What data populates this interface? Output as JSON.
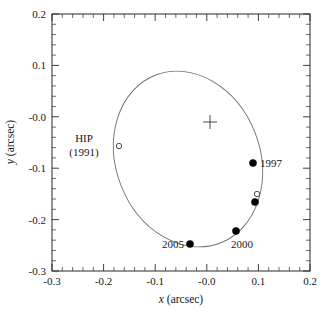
{
  "chart_data": {
    "type": "scatter",
    "title": "",
    "xlabel": "x (arcsec)",
    "ylabel": "y (arcsec)",
    "xlim": [
      -0.3,
      0.2
    ],
    "ylim": [
      -0.3,
      0.2
    ],
    "grid": false,
    "legend": "none",
    "xticks": [
      "-0.3",
      "-0.2",
      "-0.1",
      "-0.0",
      "0.1",
      "0.2"
    ],
    "xtick_values": [
      -0.3,
      -0.2,
      -0.1,
      0.0,
      0.1,
      0.2
    ],
    "yticks": [
      "0.2",
      "0.1",
      "-0.0",
      "-0.1",
      "-0.2",
      "-0.3"
    ],
    "ytick_values": [
      0.2,
      0.1,
      0.0,
      -0.1,
      -0.2,
      -0.3
    ],
    "series": [
      {
        "name": "orbit-ellipse",
        "type": "line",
        "style": "solid-thin-gray",
        "description": "fitted relative orbit ellipse"
      },
      {
        "name": "measured-positions",
        "type": "scatter",
        "marker": "filled-circle",
        "points": [
          {
            "x": 0.09,
            "y": -0.089,
            "label": "1997"
          },
          {
            "x": 0.093,
            "y": -0.165,
            "label": ""
          },
          {
            "x": 0.057,
            "y": -0.221,
            "label": "2000"
          },
          {
            "x": -0.032,
            "y": -0.246,
            "label": "2005"
          }
        ]
      },
      {
        "name": "open-circle-positions",
        "type": "scatter",
        "marker": "open-circle",
        "points": [
          {
            "x": -0.17,
            "y": -0.056,
            "label": "HIP (1991)"
          },
          {
            "x": 0.097,
            "y": -0.149,
            "label": ""
          }
        ]
      },
      {
        "name": "primary-star",
        "type": "scatter",
        "marker": "plus-cross",
        "points": [
          {
            "x": -0.007,
            "y": -0.009,
            "label": ""
          }
        ]
      }
    ],
    "annotations": [
      {
        "name": "hip-label-line1",
        "text": "HIP",
        "x": -0.225,
        "y": -0.04
      },
      {
        "name": "hip-label-line2",
        "text": "(1991)",
        "x": -0.232,
        "y": -0.065
      },
      {
        "name": "label-1997",
        "text": "1997",
        "x": 0.105,
        "y": -0.086
      },
      {
        "name": "label-2000",
        "text": "2000",
        "x": 0.062,
        "y": -0.252
      },
      {
        "name": "label-2005",
        "text": "2005",
        "x": -0.082,
        "y": -0.253
      }
    ]
  },
  "axes": {
    "x_title_italic": "x",
    "x_title_rest": " (arcsec)",
    "y_title_italic": "y",
    "y_title_rest": " (arcsec)"
  },
  "labels": {
    "hip_line1": "HIP",
    "hip_line2": "(1991)",
    "y1997": "1997",
    "y2000": "2000",
    "y2005": "2005"
  },
  "xticks": {
    "t0": "-0.3",
    "t1": "-0.2",
    "t2": "-0.1",
    "t3": "-0.0",
    "t4": "0.1",
    "t5": "0.2"
  },
  "yticks": {
    "t0": "0.2",
    "t1": "0.1",
    "t2": "-0.0",
    "t3": "-0.1",
    "t4": "-0.2",
    "t5": "-0.3"
  },
  "colors": {
    "frame": "#2b2b2b",
    "orbit": "#6e6e6e",
    "marker_filled": "#050505",
    "marker_open_stroke": "#3a3a3a",
    "cross": "#4a4a4a",
    "background": "#ffffff"
  }
}
